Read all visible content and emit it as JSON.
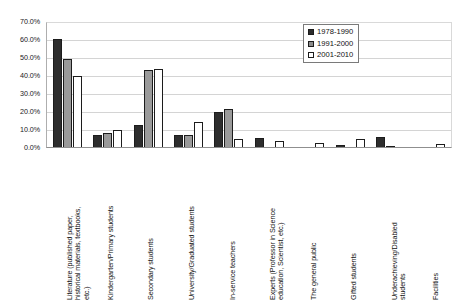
{
  "chart_data": {
    "type": "bar",
    "title": "",
    "subtitle": "",
    "xlabel": "",
    "ylabel": "",
    "ylim": [
      0,
      70
    ],
    "grid": true,
    "legend_position": "top-right",
    "y_ticks": [
      "0.0%",
      "10.0%",
      "20.0%",
      "30.0%",
      "40.0%",
      "50.0%",
      "60.0%",
      "70.0%"
    ],
    "y_tick_values": [
      0,
      10,
      20,
      30,
      40,
      50,
      60,
      70
    ],
    "categories": [
      "Literature (published paper,\nhistorical materials, textbooks,\netc.)",
      "Kindergarten/Primary students",
      "Secondary students",
      "University/Graduated students",
      "In-service teachers",
      "Experts (Professor in Science\neducation, Scientist, etc.)",
      "The general public",
      "Gifted students",
      "Underachieving/Disabled\nstudents",
      "Facilities"
    ],
    "series": [
      {
        "name": "1978-1990",
        "color": "#2d2d2d",
        "values": [
          60.2,
          6.5,
          12.0,
          6.5,
          19.5,
          5.0,
          0.0,
          1.0,
          5.5,
          0.0
        ]
      },
      {
        "name": "1991-2000",
        "color": "#9a9a9a",
        "values": [
          48.8,
          8.0,
          43.0,
          6.7,
          21.0,
          0.0,
          0.0,
          0.0,
          0.8,
          0.0
        ]
      },
      {
        "name": "2001-2010",
        "color": "#ffffff",
        "values": [
          39.5,
          9.3,
          43.5,
          14.0,
          4.7,
          3.5,
          2.0,
          4.5,
          0.0,
          1.5
        ]
      }
    ]
  }
}
